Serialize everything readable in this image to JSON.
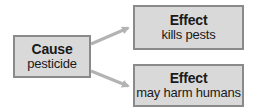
{
  "diagram": {
    "type": "cause-effect",
    "cause": {
      "title": "Cause",
      "text": "pesticide"
    },
    "effects": [
      {
        "title": "Effect",
        "text": "kills pests"
      },
      {
        "title": "Effect",
        "text": "may harm humans"
      }
    ],
    "colors": {
      "box_fill": "#d9d9d9",
      "box_border": "#8a8a8a",
      "arrow": "#b3b3b3",
      "text": "#1a1a1a"
    }
  }
}
